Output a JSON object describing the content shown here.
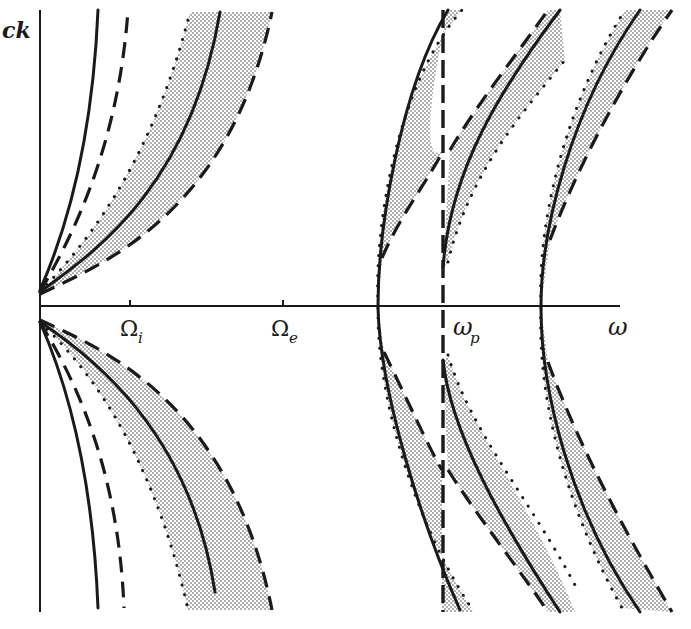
{
  "figure": {
    "type": "dispersion-diagram",
    "axes": {
      "y_label": "ck",
      "x_label": "ω",
      "x_ticks": [
        {
          "label": "Ω",
          "sub": "i",
          "x": 130
        },
        {
          "label": "Ω",
          "sub": "e",
          "x": 283
        },
        {
          "label": "ω",
          "sub": "p",
          "x": 443
        }
      ]
    },
    "colors": {
      "ink": "#1a1a1a",
      "stipple": "#9a9a9a",
      "background": "#ffffff"
    },
    "legend_styles": [
      "solid",
      "dashed",
      "dotted",
      "shaded-band"
    ]
  },
  "curves": {
    "low_freq_upper": {
      "solid_inner": "M40,290 C62,240 92,150 98,10",
      "dashed_inner": "M40,292 C70,240 118,150 128,10",
      "dotted": "M40,292 C80,250 150,170 190,12",
      "solid": "M40,292 C90,255 190,190 220,12",
      "dashed": "M40,294 C100,265 230,215 272,12"
    },
    "low_freq_lower": {
      "solid_inner": "M40,322 C62,372 92,460 98,608",
      "dashed_inner": "M40,322 C70,372 118,460 124,608",
      "dotted": "M40,322 C80,360 150,440 188,610",
      "solid": "M40,322 C90,355 190,430 215,592",
      "dashed": "M40,320 C100,348 230,400 272,610"
    },
    "branch1_upper": {
      "solid": "M378,306 C378,230 400,90 448,10",
      "dotted": "M378,306 C374,230 396,85 462,10",
      "dashed": "M382,258 C400,215 432,175 443,150"
    },
    "branch1_lower": {
      "solid": "M378,308 C380,390 420,520 460,610",
      "dotted": "M378,308 C376,390 412,520 474,612",
      "dashed": "M384,352 C405,395 430,450 442,470"
    },
    "wp_vertical": {
      "dashed": "M443,10 L443,612"
    },
    "branch2_upper": {
      "solid": "M443,268 C450,170 500,90 560,10",
      "dotted": "M448,262 C470,170 525,110 565,60",
      "dashed": "M450,150 C480,100 520,50 548,10"
    },
    "branch2_lower": {
      "solid": "M443,360 C450,430 500,520 560,612",
      "dotted": "M448,355 C470,430 530,500 575,585",
      "dashed": "M448,470 C480,520 520,570 548,612"
    },
    "branch3_upper": {
      "solid": "M541,306 C541,230 570,110 640,10",
      "dotted": "M541,306 C537,230 562,110 625,10",
      "dashed": "M550,240 C580,160 630,70 672,10"
    },
    "branch3_lower": {
      "solid": "M541,308 C541,390 570,510 640,612",
      "dotted": "M541,308 C537,390 562,500 622,608",
      "dashed": "M548,362 C580,450 630,540 672,612"
    },
    "bands": [
      "M40,292 C80,250 150,170 190,12 L272,12 C230,215 100,265 40,294 Z",
      "M40,322 C80,360 150,440 188,610 L272,610 C230,400 100,348 40,320 Z",
      "M378,306 C374,230 396,85 462,10 L448,10 C432,80 420,170 443,150 C432,175 400,215 382,258 Z",
      "M378,308 C376,390 412,520 474,612 L442,612 L442,470 C430,450 405,395 384,352 Z",
      "M443,268 C450,170 500,90 560,10 L548,10 C520,50 480,100 450,150 Z",
      "M448,262 C470,170 525,110 565,60 L560,10 C500,90 450,170 443,268 Z",
      "M443,360 C450,430 500,520 560,612 L575,612 C530,500 470,430 448,355 Z",
      "M448,470 C480,520 520,570 548,612 L560,612 C500,520 450,430 443,360 Z",
      "M541,306 C537,230 562,110 625,10 L672,10 C630,70 580,160 550,240 Z",
      "M541,308 C537,390 562,500 622,608 L672,612 C630,540 580,450 548,362 Z"
    ]
  }
}
